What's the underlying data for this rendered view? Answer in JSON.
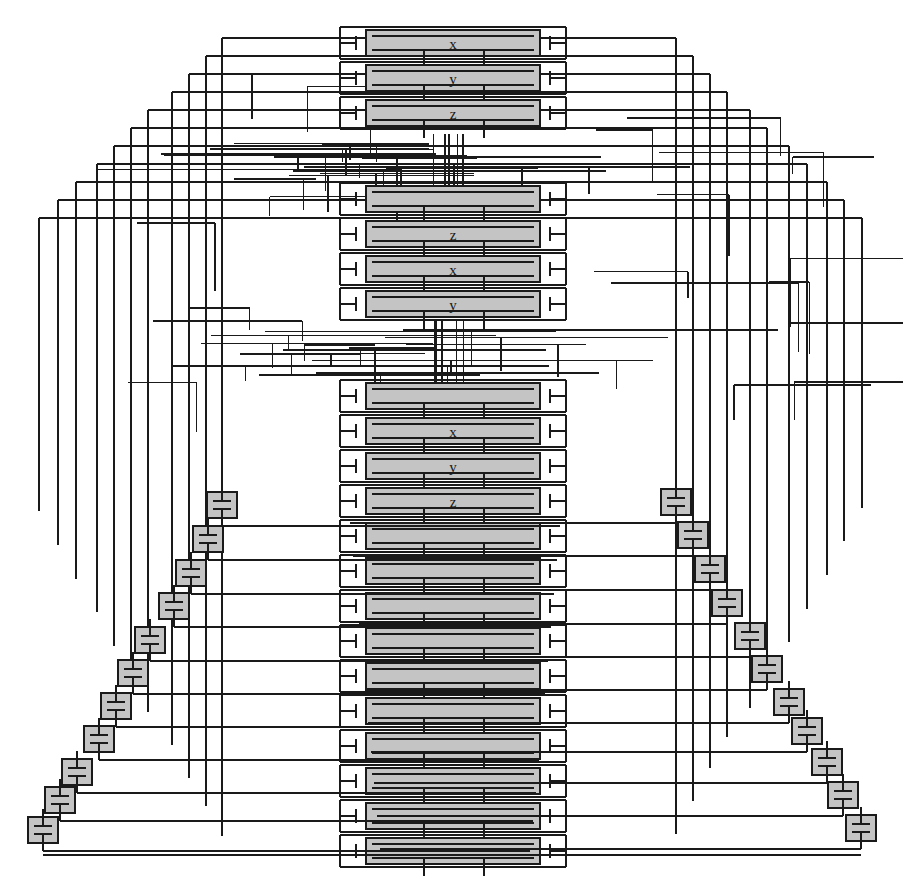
{
  "diagram": {
    "type": "vlsi-place-and-route-layout",
    "canvas": {
      "width": 903,
      "height": 888,
      "background": "#ffffff"
    },
    "colors": {
      "cell_fill": "#c4c4c4",
      "cell_stroke": "#1a1a1a",
      "wire": "#1a1a1a",
      "wire_light": "#9a9a9a",
      "pad_fill": "#c4c4c4",
      "text": "#1a1a1a",
      "background": "#ffffff"
    },
    "cell_column": {
      "label": "standard-cell column",
      "x_left": 366,
      "x_right": 540,
      "pin_rail_left": 340,
      "pin_rail_right": 566,
      "row_height": 26,
      "row_pitch": 35,
      "groups": [
        {
          "name": "group-1",
          "y_top": 30,
          "rows": 3,
          "labels": [
            "x",
            "y",
            "z"
          ]
        },
        {
          "name": "group-2",
          "y_top": 186,
          "rows": 4,
          "labels": [
            "",
            "z",
            "x",
            "y"
          ]
        },
        {
          "name": "group-3",
          "y_top": 383,
          "rows": 14,
          "labels": [
            "",
            "x",
            "y",
            "z",
            "",
            "",
            "",
            "",
            "",
            "",
            "",
            "",
            "",
            ""
          ]
        }
      ]
    },
    "cell_labels": [
      "x",
      "y",
      "z",
      "z",
      "x",
      "y",
      "x",
      "y",
      "z"
    ],
    "pad_symbol": {
      "name": "capacitor-pad",
      "width": 30,
      "height": 26,
      "description": "gray square containing a capacitor symbol with vertical stubs"
    },
    "left_pads_y": [
      505,
      539,
      573,
      606,
      640,
      673,
      706,
      739,
      772,
      800,
      830
    ],
    "right_pads_y": [
      502,
      535,
      569,
      603,
      636,
      669,
      702,
      731,
      762,
      795,
      828
    ],
    "left_pads_x": [
      222,
      208,
      191,
      174,
      150,
      133,
      116,
      99,
      77,
      60,
      43
    ],
    "right_pads_x": [
      676,
      693,
      710,
      727,
      750,
      767,
      789,
      807,
      827,
      843,
      861
    ],
    "routing": {
      "left_bus_x": [
        39,
        58,
        76,
        97,
        114,
        131,
        148,
        172,
        189,
        206,
        222
      ],
      "right_bus_x": [
        862,
        844,
        827,
        807,
        789,
        767,
        750,
        727,
        710,
        693,
        676
      ],
      "channel_gaps": [
        {
          "name": "channel-1",
          "y_top": 140,
          "y_bottom": 186
        },
        {
          "name": "channel-2",
          "y_top": 327,
          "y_bottom": 383
        }
      ]
    },
    "legend": {
      "cell": "logic cell (shaded)",
      "pin": "pin / terminal stub",
      "net": "routed net segment",
      "pad": "capacitor / I-O pad"
    }
  }
}
